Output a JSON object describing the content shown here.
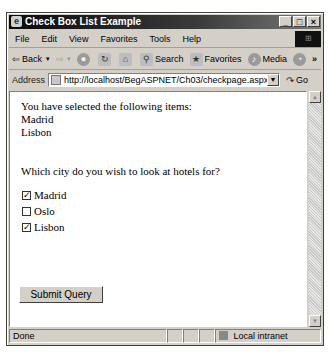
{
  "window": {
    "title": "Check Box List Example",
    "controls": [
      "_",
      "□",
      "×"
    ]
  },
  "menubar": {
    "items": [
      "File",
      "Edit",
      "View",
      "Favorites",
      "Tools",
      "Help"
    ]
  },
  "toolbar": {
    "back": "Back",
    "search": "Search",
    "favorites": "Favorites",
    "media": "Media",
    "more": "»"
  },
  "addressbar": {
    "label": "Address",
    "url": "http://localhost/BegASPNET/Ch03/checkpage.aspx",
    "go": "Go"
  },
  "page": {
    "selected_heading": "You have selected the following items:",
    "selected_items": [
      "Madrid",
      "Lisbon"
    ],
    "question": "Which city do you wish to look at hotels for?",
    "options": [
      {
        "label": "Madrid",
        "checked": true
      },
      {
        "label": "Oslo",
        "checked": false
      },
      {
        "label": "Lisbon",
        "checked": true
      }
    ],
    "submit_label": "Submit Query"
  },
  "statusbar": {
    "status": "Done",
    "zone": "Local intranet"
  }
}
